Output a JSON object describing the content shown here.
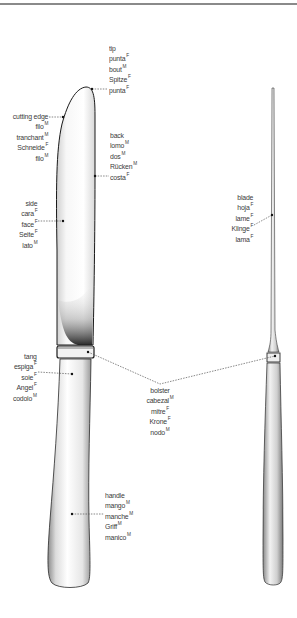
{
  "figure": {
    "views": [
      "knife-front-view",
      "knife-side-view"
    ],
    "colors": {
      "outline": "#1a1a1a",
      "leader": "#555555",
      "text": "#3a3a3a",
      "rule": "#8a8a8a"
    }
  },
  "labels": {
    "tip": {
      "terms": [
        {
          "w": "tip",
          "g": ""
        },
        {
          "w": "punta",
          "g": "F"
        },
        {
          "w": "bout",
          "g": "M"
        },
        {
          "w": "Spitze",
          "g": "F"
        },
        {
          "w": "punta",
          "g": "F"
        }
      ]
    },
    "cutting_edge": {
      "terms": [
        {
          "w": "cutting edge",
          "g": ""
        },
        {
          "w": "filo",
          "g": "M"
        },
        {
          "w": "tranchant",
          "g": "M"
        },
        {
          "w": "Schneide",
          "g": "F"
        },
        {
          "w": "filo",
          "g": "M"
        }
      ]
    },
    "back": {
      "terms": [
        {
          "w": "back",
          "g": ""
        },
        {
          "w": "lomo",
          "g": "M"
        },
        {
          "w": "dos",
          "g": "M"
        },
        {
          "w": "Rücken",
          "g": "M"
        },
        {
          "w": "costa",
          "g": "F"
        }
      ]
    },
    "side": {
      "terms": [
        {
          "w": "side",
          "g": ""
        },
        {
          "w": "cara",
          "g": "F"
        },
        {
          "w": "face",
          "g": "F"
        },
        {
          "w": "Seite",
          "g": "F"
        },
        {
          "w": "lato",
          "g": "M"
        }
      ]
    },
    "blade": {
      "terms": [
        {
          "w": "blade",
          "g": ""
        },
        {
          "w": "hoja",
          "g": "F"
        },
        {
          "w": "lame",
          "g": "F"
        },
        {
          "w": "Klinge",
          "g": "F"
        },
        {
          "w": "lama",
          "g": "F"
        }
      ]
    },
    "tang": {
      "terms": [
        {
          "w": "tang",
          "g": ""
        },
        {
          "w": "espiga",
          "g": "F"
        },
        {
          "w": "soie",
          "g": "F"
        },
        {
          "w": "Angel",
          "g": "F"
        },
        {
          "w": "codolo",
          "g": "M"
        }
      ]
    },
    "bolster": {
      "terms": [
        {
          "w": "bolster",
          "g": ""
        },
        {
          "w": "cabezal",
          "g": "M"
        },
        {
          "w": "mitre",
          "g": "F"
        },
        {
          "w": "Krone",
          "g": "F"
        },
        {
          "w": "nodo",
          "g": "M"
        }
      ]
    },
    "handle": {
      "terms": [
        {
          "w": "handle",
          "g": ""
        },
        {
          "w": "mango",
          "g": "M"
        },
        {
          "w": "manche",
          "g": "M"
        },
        {
          "w": "Griff",
          "g": "M"
        },
        {
          "w": "manico",
          "g": "M"
        }
      ]
    }
  }
}
